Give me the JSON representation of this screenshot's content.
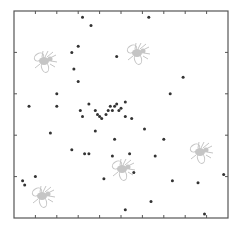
{
  "chart_data": {
    "type": "scatter",
    "title": "",
    "xlabel": "",
    "ylabel": "",
    "xlim": [
      0,
      1
    ],
    "ylim": [
      0,
      1
    ],
    "grid": false,
    "legend": null,
    "frame": {
      "left": 14,
      "top": 11,
      "right": 228,
      "bottom": 218
    },
    "x_ticks_count": 10,
    "y_ticks_count": 5,
    "point_color": "#333333",
    "frame_color": "#555555",
    "decoration_color": "#bbbbbb",
    "points": [
      {
        "x": 0.32,
        "y": 0.97
      },
      {
        "x": 0.36,
        "y": 0.93
      },
      {
        "x": 0.63,
        "y": 0.97
      },
      {
        "x": 0.3,
        "y": 0.83
      },
      {
        "x": 0.27,
        "y": 0.8
      },
      {
        "x": 0.48,
        "y": 0.78
      },
      {
        "x": 0.28,
        "y": 0.72
      },
      {
        "x": 0.3,
        "y": 0.66
      },
      {
        "x": 0.2,
        "y": 0.6
      },
      {
        "x": 0.73,
        "y": 0.6
      },
      {
        "x": 0.07,
        "y": 0.54
      },
      {
        "x": 0.2,
        "y": 0.54
      },
      {
        "x": 0.31,
        "y": 0.52
      },
      {
        "x": 0.35,
        "y": 0.55
      },
      {
        "x": 0.32,
        "y": 0.49
      },
      {
        "x": 0.38,
        "y": 0.52
      },
      {
        "x": 0.39,
        "y": 0.5
      },
      {
        "x": 0.4,
        "y": 0.49
      },
      {
        "x": 0.41,
        "y": 0.48
      },
      {
        "x": 0.43,
        "y": 0.5
      },
      {
        "x": 0.44,
        "y": 0.52
      },
      {
        "x": 0.45,
        "y": 0.54
      },
      {
        "x": 0.46,
        "y": 0.52
      },
      {
        "x": 0.47,
        "y": 0.54
      },
      {
        "x": 0.48,
        "y": 0.55
      },
      {
        "x": 0.49,
        "y": 0.52
      },
      {
        "x": 0.5,
        "y": 0.53
      },
      {
        "x": 0.52,
        "y": 0.56
      },
      {
        "x": 0.52,
        "y": 0.49
      },
      {
        "x": 0.55,
        "y": 0.48
      },
      {
        "x": 0.38,
        "y": 0.42
      },
      {
        "x": 0.47,
        "y": 0.38
      },
      {
        "x": 0.27,
        "y": 0.33
      },
      {
        "x": 0.33,
        "y": 0.31
      },
      {
        "x": 0.35,
        "y": 0.31
      },
      {
        "x": 0.46,
        "y": 0.3
      },
      {
        "x": 0.54,
        "y": 0.31
      },
      {
        "x": 0.17,
        "y": 0.41
      },
      {
        "x": 0.42,
        "y": 0.19
      },
      {
        "x": 0.04,
        "y": 0.18
      },
      {
        "x": 0.05,
        "y": 0.16
      },
      {
        "x": 0.1,
        "y": 0.2
      },
      {
        "x": 0.79,
        "y": 0.68
      },
      {
        "x": 0.7,
        "y": 0.38
      },
      {
        "x": 0.61,
        "y": 0.43
      },
      {
        "x": 0.66,
        "y": 0.3
      },
      {
        "x": 0.56,
        "y": 0.22
      },
      {
        "x": 0.74,
        "y": 0.18
      },
      {
        "x": 0.86,
        "y": 0.17
      },
      {
        "x": 0.98,
        "y": 0.21
      },
      {
        "x": 0.52,
        "y": 0.04
      },
      {
        "x": 0.89,
        "y": 0.02
      },
      {
        "x": 0.64,
        "y": 0.08
      }
    ],
    "decorations": [
      {
        "type": "bee-icon",
        "cx": 44,
        "cy": 61
      },
      {
        "type": "bee-icon",
        "cx": 137,
        "cy": 53
      },
      {
        "type": "bee-icon",
        "cx": 200,
        "cy": 152
      },
      {
        "type": "bee-icon",
        "cx": 122,
        "cy": 169
      },
      {
        "type": "bee-icon",
        "cx": 42,
        "cy": 196
      }
    ]
  }
}
